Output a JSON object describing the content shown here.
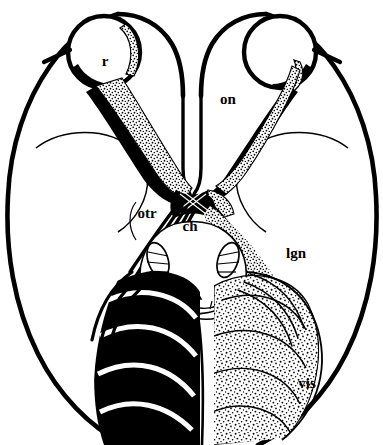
{
  "figure": {
    "type": "anatomical-line-diagram",
    "background_color": "#ffffff",
    "ink_color": "#000000",
    "labels": [
      {
        "key": "r",
        "text": "r",
        "meaning": "retina",
        "x": 105,
        "y": 66
      },
      {
        "key": "on",
        "text": "on",
        "meaning": "optic nerve",
        "x": 228,
        "y": 104
      },
      {
        "key": "otr",
        "text": "otr",
        "meaning": "optic tract",
        "x": 138,
        "y": 218
      },
      {
        "key": "ch",
        "text": "ch",
        "meaning": "optic chiasm",
        "x": 186,
        "y": 226
      },
      {
        "key": "lgn",
        "text": "lgn",
        "meaning": "lateral geniculate nucleus",
        "x": 288,
        "y": 256
      },
      {
        "key": "vis",
        "text": "vis",
        "meaning": "visual cortex",
        "x": 299,
        "y": 386
      }
    ],
    "hemispheres": {
      "left": {
        "shading": "solid-black",
        "represents": "crossed and uncrossed fibres of one eye"
      },
      "right": {
        "shading": "stipple-dots",
        "represents": "crossed and uncrossed fibres of the other eye"
      }
    },
    "structures": [
      {
        "name": "left-eye-retina",
        "shading": "outline"
      },
      {
        "name": "right-eye-retina",
        "shading": "outline"
      },
      {
        "name": "optic-nerve-left",
        "shading": "solid-black"
      },
      {
        "name": "optic-nerve-right",
        "shading": "stipple-dots"
      },
      {
        "name": "optic-chiasm",
        "shading": "mixed"
      },
      {
        "name": "optic-tract-left",
        "shading": "solid-black"
      },
      {
        "name": "optic-tract-right",
        "shading": "stipple-dots"
      },
      {
        "name": "lateral-geniculate-nucleus-left",
        "shading": "outline"
      },
      {
        "name": "lateral-geniculate-nucleus-right",
        "shading": "outline"
      },
      {
        "name": "optic-radiation-left",
        "shading": "solid-black-bands"
      },
      {
        "name": "optic-radiation-right",
        "shading": "stipple-bands"
      },
      {
        "name": "midbrain",
        "shading": "outline"
      },
      {
        "name": "cerebral-peduncles",
        "shading": "outline"
      },
      {
        "name": "frontal-lobe-left",
        "shading": "outline"
      },
      {
        "name": "frontal-lobe-right",
        "shading": "outline"
      },
      {
        "name": "temporal-lobe-left",
        "shading": "outline"
      },
      {
        "name": "temporal-lobe-right",
        "shading": "outline"
      },
      {
        "name": "interhemispheric-fissure",
        "shading": "outline"
      }
    ]
  }
}
